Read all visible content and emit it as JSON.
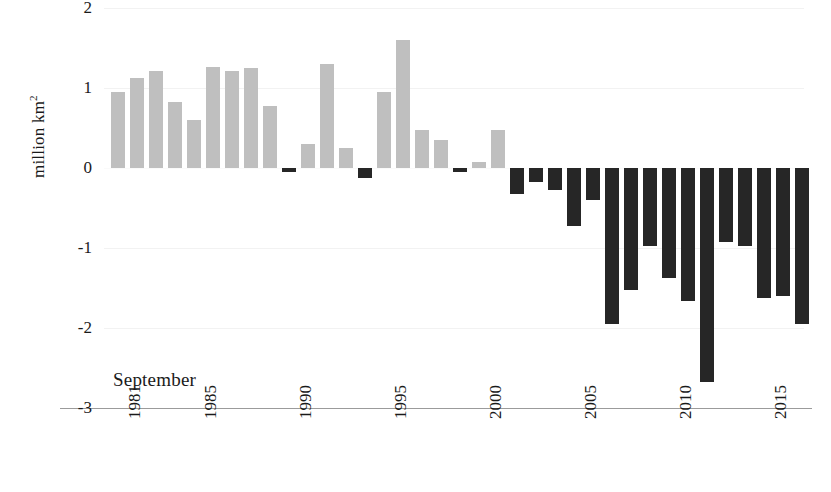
{
  "chart_data": {
    "type": "bar",
    "title": "",
    "subtitle": "",
    "annotation": "September",
    "xlabel": "",
    "ylabel": "million km²",
    "ylabel_text": "million km",
    "ylabel_sup": "2",
    "ylim": [
      -3,
      2
    ],
    "grid": true,
    "legend": "none",
    "y_ticks": [
      2,
      1,
      0,
      -1,
      -2,
      -3
    ],
    "y_tick_labels": [
      "2",
      "1",
      "0",
      "-1",
      "-2",
      "-3"
    ],
    "x_tick_labels": [
      "1981",
      "1985",
      "1990",
      "1995",
      "2000",
      "2005",
      "2010",
      "2015"
    ],
    "x_tick_years": [
      1981,
      1985,
      1990,
      1995,
      2000,
      2005,
      2010,
      2015
    ],
    "categories": [
      1981,
      1982,
      1983,
      1984,
      1985,
      1986,
      1987,
      1988,
      1989,
      1990,
      1991,
      1992,
      1993,
      1994,
      1995,
      1996,
      1997,
      1998,
      1999,
      2000,
      2001,
      2002,
      2003,
      2004,
      2005,
      2006,
      2007,
      2008,
      2009,
      2010,
      2011,
      2012,
      2013,
      2014,
      2015,
      2016,
      2017
    ],
    "values": [
      0.95,
      1.13,
      1.21,
      0.82,
      0.6,
      1.26,
      1.21,
      1.25,
      0.77,
      -0.05,
      0.3,
      1.3,
      0.25,
      -0.13,
      0.95,
      1.6,
      0.47,
      0.35,
      -0.05,
      0.08,
      0.47,
      -0.33,
      -0.17,
      -0.28,
      -0.72,
      -0.4,
      -1.95,
      -1.53,
      -0.97,
      -1.37,
      -1.66,
      -2.68,
      -0.93,
      -0.97,
      -1.62,
      -1.6,
      -1.95
    ],
    "positive_color": "#bfbfbf",
    "negative_color": "#262626",
    "axis_color": "#9b9b9b",
    "gridline_color": "#f2f2f2",
    "background_color": "#ffffff"
  }
}
